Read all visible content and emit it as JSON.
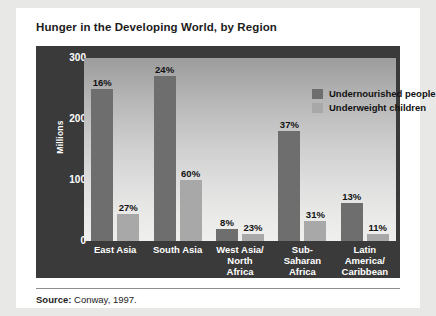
{
  "card": {
    "title": "Hunger in the Developing World, by Region",
    "source_label": "Source:",
    "source_text": "Conway, 1997."
  },
  "chart_data": {
    "type": "bar",
    "title": "Hunger in the Developing World, by Region",
    "xlabel": "",
    "ylabel": "Millions",
    "ylim": [
      0,
      300
    ],
    "yticks": [
      0,
      100,
      200,
      300
    ],
    "grid": false,
    "legend_position": "top-right",
    "categories": [
      "East Asia",
      "South Asia",
      "West Asia/\nNorth\nAfrica",
      "Sub-\nSaharan\nAfrica",
      "Latin\nAmerica/\nCaribbean"
    ],
    "category_lines": [
      [
        "East Asia"
      ],
      [
        "South Asia"
      ],
      [
        "West Asia/",
        "North",
        "Africa"
      ],
      [
        "Sub-",
        "Saharan",
        "Africa"
      ],
      [
        "Latin",
        "America/",
        "Caribbean"
      ]
    ],
    "series": [
      {
        "name": "Undernourished people",
        "color": "#6e6e6e",
        "values": [
          250,
          270,
          20,
          180,
          63
        ],
        "data_labels": [
          "16%",
          "24%",
          "8%",
          "37%",
          "13%"
        ]
      },
      {
        "name": "Underweight children",
        "color": "#a8a8a8",
        "values": [
          45,
          100,
          12,
          33,
          12
        ],
        "data_labels": [
          "27%",
          "60%",
          "23%",
          "31%",
          "11%"
        ]
      }
    ]
  }
}
